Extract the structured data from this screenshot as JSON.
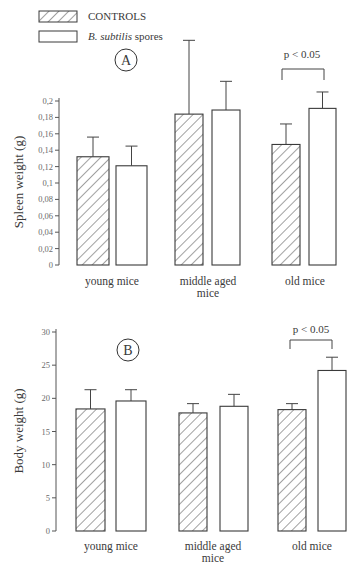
{
  "legend": {
    "controls_label": "CONTROLS",
    "spores_label_italic": "B. subtilis",
    "spores_label_rest": " spores"
  },
  "panel_a": {
    "letter": "A",
    "p_label": "p < 0.05"
  },
  "panel_b": {
    "letter": "B",
    "p_label": "p < 0.05"
  },
  "chart_data": [
    {
      "type": "bar",
      "panel": "A",
      "title": "",
      "ylabel": "Spleen weight (g)",
      "xlabel": "",
      "categories": [
        "young mice",
        "middle aged mice",
        "old mice"
      ],
      "ylim": [
        0,
        0.2
      ],
      "yticks": [
        "0",
        "0,02",
        "0,04",
        "0,06",
        "0,08",
        "0,1",
        "0,12",
        "0,14",
        "0,16",
        "0,18",
        "0,2"
      ],
      "grid": false,
      "legend_position": "top-left",
      "series": [
        {
          "name": "CONTROLS",
          "pattern": "hatched",
          "values": [
            0.132,
            0.184,
            0.147
          ],
          "error_upper": [
            0.156,
            0.274,
            0.172
          ]
        },
        {
          "name": "B. subtilis spores",
          "pattern": "white",
          "values": [
            0.121,
            0.189,
            0.191
          ],
          "error_upper": [
            0.145,
            0.224,
            0.211
          ]
        }
      ],
      "annotations": [
        {
          "text": "p < 0.05",
          "category": "old mice",
          "type": "significance-bracket"
        }
      ]
    },
    {
      "type": "bar",
      "panel": "B",
      "title": "",
      "ylabel": "Body weight (g)",
      "xlabel": "",
      "categories": [
        "young mice",
        "middle aged mice",
        "old mice"
      ],
      "ylim": [
        0,
        30
      ],
      "yticks": [
        "0",
        "5",
        "10",
        "15",
        "20",
        "25",
        "30"
      ],
      "grid": false,
      "series": [
        {
          "name": "CONTROLS",
          "pattern": "hatched",
          "values": [
            18.4,
            17.8,
            18.3
          ],
          "error_upper": [
            21.3,
            19.2,
            19.2
          ]
        },
        {
          "name": "B. subtilis spores",
          "pattern": "white",
          "values": [
            19.6,
            18.8,
            24.2
          ],
          "error_upper": [
            21.3,
            20.6,
            26.2
          ]
        }
      ],
      "annotations": [
        {
          "text": "p < 0.05",
          "category": "old mice",
          "type": "significance-bracket"
        }
      ]
    }
  ]
}
